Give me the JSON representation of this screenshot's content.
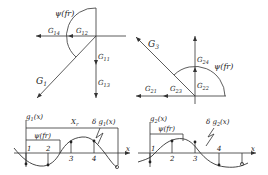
{
  "left_vector_diagram": {
    "arc_label": "ψ(fr)",
    "G14": "G14",
    "G12": "G12",
    "G11": "G11",
    "G13": "G13",
    "G1": "G1"
  },
  "right_vector_diagram": {
    "arc_label": "ψ(fr)",
    "G3": "G3",
    "G24": "G24",
    "G22": "G22",
    "G21": "G21",
    "G23": "G23"
  },
  "left_wave_plot": {
    "y_label": "g1(x)",
    "span_label": "Xr",
    "psi_label": "ψ(fr)",
    "delta_label": "δ g1(x)",
    "x_axis_label": "x",
    "points": [
      "1",
      "2",
      "3",
      "4"
    ]
  },
  "right_wave_plot": {
    "y_label": "g2(x)",
    "psi_label": "ψ(fr)",
    "delta_label": "δ g2(x)",
    "x_axis_label": "x",
    "points": [
      "1",
      "2",
      "3",
      "4"
    ]
  }
}
